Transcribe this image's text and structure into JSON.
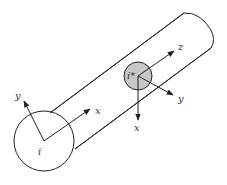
{
  "diagram": {
    "type": "cylinder-coordinate-frames",
    "colors": {
      "stroke": "#222222",
      "inner_fill": "#c8c8c8",
      "label": "#333333",
      "background": "#ffffff"
    },
    "end_cap": {
      "label": "i",
      "axes": {
        "x": "x",
        "y": "y"
      }
    },
    "inner_disk": {
      "label": "i*",
      "axes": {
        "z": "z",
        "y": "y",
        "x": "x"
      }
    }
  }
}
